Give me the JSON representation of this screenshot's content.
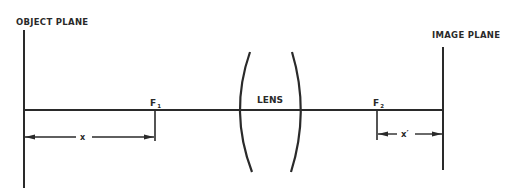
{
  "diagram": {
    "type": "optics-lens-diagram",
    "labels": {
      "object_plane": "OBJECT PLANE",
      "image_plane": "IMAGE PLANE",
      "lens": "LENS",
      "f1": "F",
      "f1_sub": "1",
      "f2": "F",
      "f2_sub": "2",
      "x": "x",
      "x_prime": "x′"
    },
    "colors": {
      "ink": "#2a2a2a",
      "background": "#ffffff"
    }
  }
}
